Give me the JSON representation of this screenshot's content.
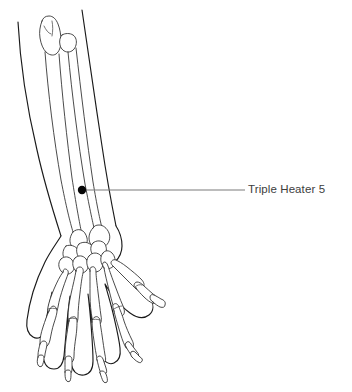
{
  "figure": {
    "background_color": "#ffffff",
    "line_color": "#1a1a1a",
    "bone_line_color": "#2b2b2b"
  },
  "annotation": {
    "label": "Triple Heater 5",
    "label_color": "#3d3d3d",
    "leader_line_color": "#7b7b7b",
    "marker_color": "#060606",
    "marker_x": 82,
    "marker_y": 190,
    "marker_radius": 4.2,
    "leader_start_x": 86,
    "leader_end_x": 245,
    "leader_y": 190
  },
  "anatomy": {
    "parts": [
      "forearm skin outline",
      "ulna",
      "radius",
      "olecranon",
      "carpal bones",
      "metacarpals",
      "proximal phalanges",
      "middle phalanges",
      "distal phalanges",
      "thumb"
    ]
  }
}
